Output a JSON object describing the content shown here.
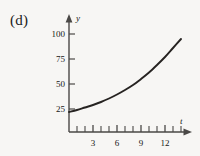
{
  "panel": {
    "label": "(d)"
  },
  "chart_data": {
    "type": "line",
    "title": "",
    "xlabel": "t",
    "ylabel": "y",
    "grid": false,
    "legend": null,
    "xlim": [
      0,
      14.5
    ],
    "ylim": [
      0,
      108
    ],
    "x_ticks_major": [
      3,
      6,
      9,
      12
    ],
    "x_tick_labels": [
      "3",
      "6",
      "9",
      "12"
    ],
    "x_ticks_minor": [
      1,
      2,
      4,
      5,
      7,
      8,
      10,
      11,
      13,
      14
    ],
    "y_ticks_major": [
      25,
      50,
      75,
      100
    ],
    "y_tick_labels": [
      "25",
      "50",
      "75",
      "100"
    ],
    "series": [
      {
        "name": "exponential growth",
        "x": [
          0,
          1,
          2,
          3,
          4,
          5,
          6,
          7,
          8,
          9,
          10,
          11,
          12,
          13,
          14
        ],
        "values": [
          20,
          22,
          24.5,
          27,
          30,
          33.5,
          37.5,
          42,
          47,
          53,
          59.5,
          67,
          75,
          84,
          93
        ]
      }
    ],
    "curve_color": "#262321",
    "axis_color": "#4a4846",
    "background_color": "#f7f6f4"
  }
}
